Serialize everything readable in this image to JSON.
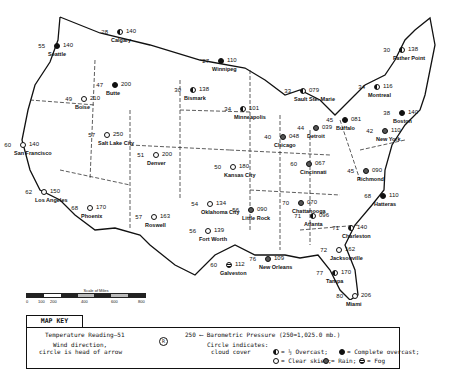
{
  "map": {
    "title": "U.S. Weather Map",
    "stations": [
      {
        "city": "Calgary",
        "temp": "28",
        "pressure": "140",
        "cover": "half",
        "x": 121,
        "y": 33
      },
      {
        "city": "Seattle",
        "temp": "55",
        "pressure": "140",
        "cover": "full",
        "x": 58,
        "y": 47
      },
      {
        "city": "Butte",
        "temp": "47",
        "pressure": "200",
        "cover": "full",
        "x": 116,
        "y": 86
      },
      {
        "city": "Boise",
        "temp": "49",
        "pressure": "210",
        "cover": "clear",
        "x": 85,
        "y": 100
      },
      {
        "city": "Winnipeg",
        "temp": "27",
        "pressure": "110",
        "cover": "full",
        "x": 222,
        "y": 62
      },
      {
        "city": "Bismark",
        "temp": "30",
        "pressure": "138",
        "cover": "half",
        "x": 194,
        "y": 91
      },
      {
        "city": "Minneapolis",
        "temp": "34",
        "pressure": "101",
        "cover": "half",
        "x": 244,
        "y": 110
      },
      {
        "city": "Sault Ste. Marie",
        "temp": "33",
        "pressure": "079",
        "cover": "half",
        "x": 304,
        "y": 92
      },
      {
        "city": "Father Point",
        "temp": "30",
        "pressure": "138",
        "cover": "half",
        "x": 403,
        "y": 51
      },
      {
        "city": "Montreal",
        "temp": "34",
        "pressure": "116",
        "cover": "half",
        "x": 378,
        "y": 88
      },
      {
        "city": "Boston",
        "temp": "38",
        "pressure": "140",
        "cover": "full",
        "x": 403,
        "y": 114
      },
      {
        "city": "Buffalo",
        "temp": "45",
        "pressure": "081",
        "cover": "full",
        "x": 346,
        "y": 121
      },
      {
        "city": "Detroit",
        "temp": "44",
        "pressure": "039",
        "cover": "rain",
        "x": 317,
        "y": 129
      },
      {
        "city": "Chicago",
        "temp": "40",
        "pressure": "048",
        "cover": "rain",
        "x": 284,
        "y": 138
      },
      {
        "city": "New York",
        "temp": "42",
        "pressure": "110",
        "cover": "rain",
        "x": 386,
        "y": 132
      },
      {
        "city": "San Francisco",
        "temp": "60",
        "pressure": "140",
        "cover": "clear",
        "x": 24,
        "y": 146
      },
      {
        "city": "Salt Lake City",
        "temp": "57",
        "pressure": "250",
        "cover": "clear",
        "x": 108,
        "y": 136
      },
      {
        "city": "Denver",
        "temp": "51",
        "pressure": "200",
        "cover": "clear",
        "x": 157,
        "y": 156
      },
      {
        "city": "Kansas City",
        "temp": "50",
        "pressure": "180",
        "cover": "clear",
        "x": 234,
        "y": 168
      },
      {
        "city": "Cincinnati",
        "temp": "60",
        "pressure": "067",
        "cover": "rain",
        "x": 310,
        "y": 165
      },
      {
        "city": "Richmond",
        "temp": "45",
        "pressure": "090",
        "cover": "rain",
        "x": 367,
        "y": 172
      },
      {
        "city": "Hatteras",
        "temp": "68",
        "pressure": "110",
        "cover": "full",
        "x": 384,
        "y": 197
      },
      {
        "city": "Los Angeles",
        "temp": "62",
        "pressure": "150",
        "cover": "clear",
        "x": 45,
        "y": 193
      },
      {
        "city": "Phoenix",
        "temp": "68",
        "pressure": "170",
        "cover": "clear",
        "x": 91,
        "y": 209
      },
      {
        "city": "Roswell",
        "temp": "57",
        "pressure": "163",
        "cover": "clear",
        "x": 155,
        "y": 218
      },
      {
        "city": "Oklahoma City",
        "temp": "54",
        "pressure": "134",
        "cover": "clear",
        "x": 211,
        "y": 205
      },
      {
        "city": "Fort Worth",
        "temp": "56",
        "pressure": "139",
        "cover": "clear",
        "x": 209,
        "y": 232
      },
      {
        "city": "Little Rock",
        "temp": "56",
        "pressure": "090",
        "cover": "rain",
        "x": 252,
        "y": 211
      },
      {
        "city": "Chattanooga",
        "temp": "70",
        "pressure": "070",
        "cover": "rain",
        "x": 302,
        "y": 204
      },
      {
        "city": "Atlanta",
        "temp": "71",
        "pressure": "096",
        "cover": "half",
        "x": 314,
        "y": 217
      },
      {
        "city": "Charleston",
        "temp": "71",
        "pressure": "140",
        "cover": "half",
        "x": 352,
        "y": 229
      },
      {
        "city": "Galveston",
        "temp": "60",
        "pressure": "112",
        "cover": "fog",
        "x": 230,
        "y": 266
      },
      {
        "city": "New Orleans",
        "temp": "76",
        "pressure": "109",
        "cover": "rain",
        "x": 269,
        "y": 260
      },
      {
        "city": "Jacksonville",
        "temp": "72",
        "pressure": "162",
        "cover": "clear",
        "x": 340,
        "y": 251
      },
      {
        "city": "Tampa",
        "temp": "77",
        "pressure": "170",
        "cover": "half",
        "x": 336,
        "y": 274
      },
      {
        "city": "Miami",
        "temp": "80",
        "pressure": "206",
        "cover": "clear",
        "x": 356,
        "y": 297
      }
    ]
  },
  "scale": {
    "title": "Scale of Miles",
    "ticks": [
      "0",
      "100",
      "200",
      "400",
      "600",
      "800"
    ]
  },
  "key": {
    "tab_label": "MAP KEY",
    "temperature_label": "Temperature Reading",
    "temperature_example": "51",
    "symbol_example": "R",
    "pressure_example": "250",
    "pressure_label": "Barometric Pressure (250=1,025.0 mb.)",
    "wind_label_1": "Wind direction,",
    "wind_label_2": "circle is head of arrow",
    "circle_label_1": "Circle indicates:",
    "circle_label_2": "cloud cover",
    "legend": {
      "half": "= ½ Overcast;",
      "full": "= Complete overcast;",
      "clear": "= Clear skies;",
      "rain": "= Rain;",
      "fog": "= Fog"
    }
  }
}
